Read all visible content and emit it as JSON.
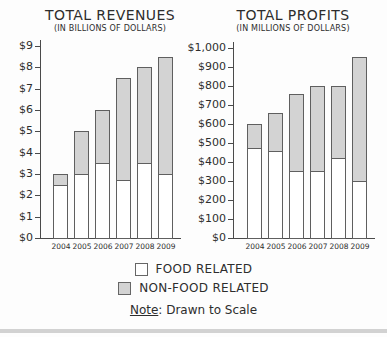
{
  "legend": {
    "items": [
      {
        "label": "FOOD RELATED",
        "swatch_color": "#ffffff"
      },
      {
        "label": "NON-FOOD RELATED",
        "swatch_color": "#d3d3d3"
      }
    ]
  },
  "note": {
    "label": "Note",
    "text": ": Drawn to Scale"
  },
  "colors": {
    "food_fill": "#ffffff",
    "nonfood_fill": "#d3d3d3",
    "bar_border": "#5f5f5f",
    "axis": "#4a4a4a",
    "text": "#2d2d2d"
  },
  "chart_data": [
    {
      "type": "bar",
      "stacked": true,
      "title": "TOTAL REVENUES",
      "subtitle": "(IN BILLIONS OF DOLLARS)",
      "categories": [
        "2004",
        "2005",
        "2006",
        "2007",
        "2008",
        "2009"
      ],
      "series": [
        {
          "name": "FOOD RELATED",
          "values": [
            2.5,
            3.0,
            3.5,
            2.7,
            3.5,
            3.0
          ]
        },
        {
          "name": "NON-FOOD RELATED",
          "values": [
            0.5,
            2.0,
            2.5,
            4.8,
            4.5,
            5.5
          ]
        }
      ],
      "totals": [
        3.0,
        5.0,
        6.0,
        7.5,
        8.0,
        8.5
      ],
      "xlabel": "",
      "ylabel": "",
      "ylim": [
        0,
        9
      ],
      "yticks": [
        0,
        1,
        2,
        3,
        4,
        5,
        6,
        7,
        8,
        9
      ],
      "ytick_labels": [
        "$0",
        "$1",
        "$2",
        "$3",
        "$4",
        "$5",
        "$6",
        "$7",
        "$8",
        "$9"
      ],
      "grid": false,
      "legend_position": "bottom-shared"
    },
    {
      "type": "bar",
      "stacked": true,
      "title": "TOTAL PROFITS",
      "subtitle": "(IN MILLIONS OF DOLLARS)",
      "categories": [
        "2004",
        "2005",
        "2006",
        "2007",
        "2008",
        "2009"
      ],
      "series": [
        {
          "name": "FOOD RELATED",
          "values": [
            475,
            460,
            355,
            355,
            420,
            300
          ]
        },
        {
          "name": "NON-FOOD RELATED",
          "values": [
            125,
            200,
            405,
            445,
            380,
            650
          ]
        }
      ],
      "totals": [
        600,
        660,
        760,
        800,
        800,
        950
      ],
      "xlabel": "",
      "ylabel": "",
      "ylim": [
        0,
        1000
      ],
      "yticks": [
        0,
        100,
        200,
        300,
        400,
        500,
        600,
        700,
        800,
        900,
        1000
      ],
      "ytick_labels": [
        "$0",
        "$100",
        "$200",
        "$300",
        "$400",
        "$500",
        "$600",
        "$700",
        "$800",
        "$900",
        "$1,000"
      ],
      "grid": false,
      "legend_position": "bottom-shared"
    }
  ]
}
